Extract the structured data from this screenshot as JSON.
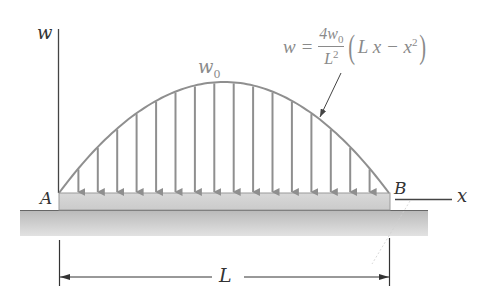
{
  "diagram": {
    "type": "distributed-load-beam",
    "labels": {
      "w_axis": "w",
      "x_axis": "x",
      "peak_load": "w",
      "peak_load_sub": "0",
      "support_left": "A",
      "support_right": "B",
      "span": "L"
    },
    "formula": {
      "lhs": "w =",
      "numerator": "4w",
      "numerator_sub": "0",
      "denominator": "L",
      "denominator_sup": "2",
      "open_paren": "(",
      "term": "L x − x",
      "term_sup": "2",
      "close_paren": ")"
    },
    "load_arrow_count": 16,
    "colors": {
      "load_curve": "#8f8f8f",
      "load_arrows": "#8f8f8f",
      "beam_fill": "#d4d4d4",
      "ground_fill": "#c8c8c8",
      "axis": "#444444",
      "text": "#333333",
      "formula_text": "#8a8a8a"
    }
  }
}
